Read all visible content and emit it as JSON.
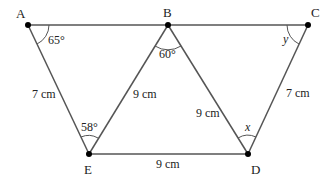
{
  "diagram": {
    "points": {
      "A": {
        "label": "A",
        "x": 28,
        "y": 25
      },
      "B": {
        "label": "B",
        "x": 168,
        "y": 25
      },
      "C": {
        "label": "C",
        "x": 308,
        "y": 25
      },
      "D": {
        "label": "D",
        "x": 248,
        "y": 154
      },
      "E": {
        "label": "E",
        "x": 89,
        "y": 154
      }
    },
    "sides": {
      "AE": "7 cm",
      "BE": "9 cm",
      "BD": "9 cm",
      "ED": "9 cm",
      "CD": "7 cm"
    },
    "angles": {
      "A": "65°",
      "B": "60°",
      "E": "58°",
      "C": "y",
      "D": "x"
    },
    "colors": {
      "line": "#555555",
      "point": "#000000",
      "text": "#222222"
    }
  }
}
